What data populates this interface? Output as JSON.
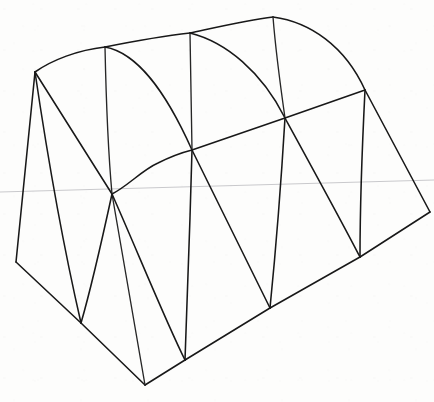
{
  "artwork": {
    "title": "Hand-drawn 3D wireframe mesh sketch",
    "subject": "barrel-vault / quonset-shaped solid drawn in perspective",
    "medium": "pen line drawing on white paper",
    "canvas": {
      "width": 434,
      "height": 402,
      "background_color": "#fdfdfc"
    },
    "ink_color": "#181818",
    "guide_color": "#c9c9cc"
  },
  "chart_data": {
    "type": "scatter",
    "xlabel": "",
    "ylabel": "",
    "xlim": [
      0,
      434
    ],
    "ylim": [
      402,
      0
    ],
    "grid": false,
    "legend": "none",
    "vertices": [
      {
        "id": "TL",
        "x": 35,
        "y": 72,
        "label": "top-left ridge corner"
      },
      {
        "id": "T1",
        "x": 105,
        "y": 47,
        "label": "top rib 1"
      },
      {
        "id": "T2",
        "x": 190,
        "y": 33,
        "label": "top rib 2"
      },
      {
        "id": "T3",
        "x": 273,
        "y": 17,
        "label": "top apex / far ridge corner"
      },
      {
        "id": "R1",
        "x": 365,
        "y": 90,
        "label": "right upper corner"
      },
      {
        "id": "FR",
        "x": 430,
        "y": 212,
        "label": "far right corner"
      },
      {
        "id": "M0",
        "x": 112,
        "y": 194,
        "label": "central convergence node"
      },
      {
        "id": "M1",
        "x": 192,
        "y": 150,
        "label": "mid node 1"
      },
      {
        "id": "M2",
        "x": 285,
        "y": 118,
        "label": "mid node 2"
      },
      {
        "id": "BL",
        "x": 16,
        "y": 262,
        "label": "bottom-left corner"
      },
      {
        "id": "B1",
        "x": 81,
        "y": 323,
        "label": "bottom node 1"
      },
      {
        "id": "B2",
        "x": 145,
        "y": 385,
        "label": "bottom front corner"
      },
      {
        "id": "B3",
        "x": 185,
        "y": 360,
        "label": "bottom node 2"
      },
      {
        "id": "B4",
        "x": 270,
        "y": 308,
        "label": "bottom node 3"
      },
      {
        "id": "B5",
        "x": 360,
        "y": 257,
        "label": "bottom node 4"
      }
    ],
    "edges": [
      {
        "from": "TL",
        "to": "T1",
        "kind": "curve"
      },
      {
        "from": "T1",
        "to": "T2",
        "kind": "curve"
      },
      {
        "from": "T2",
        "to": "T3",
        "kind": "curve"
      },
      {
        "from": "T3",
        "to": "R1",
        "kind": "curve"
      },
      {
        "from": "R1",
        "to": "FR",
        "kind": "line"
      },
      {
        "from": "FR",
        "to": "B5",
        "kind": "line"
      },
      {
        "from": "B5",
        "to": "B4",
        "kind": "line"
      },
      {
        "from": "B4",
        "to": "B3",
        "kind": "line"
      },
      {
        "from": "B3",
        "to": "B2",
        "kind": "line"
      },
      {
        "from": "B2",
        "to": "B1",
        "kind": "line"
      },
      {
        "from": "B1",
        "to": "BL",
        "kind": "line"
      },
      {
        "from": "BL",
        "to": "TL",
        "kind": "line"
      },
      {
        "from": "M0",
        "to": "M1",
        "kind": "curve"
      },
      {
        "from": "M1",
        "to": "M2",
        "kind": "line"
      },
      {
        "from": "M2",
        "to": "R1",
        "kind": "line"
      },
      {
        "from": "TL",
        "to": "M0",
        "kind": "line"
      },
      {
        "from": "T1",
        "to": "M0",
        "kind": "curve"
      },
      {
        "from": "T1",
        "to": "M1",
        "kind": "curve"
      },
      {
        "from": "T2",
        "to": "M1",
        "kind": "line"
      },
      {
        "from": "T2",
        "to": "M2",
        "kind": "curve"
      },
      {
        "from": "T3",
        "to": "M2",
        "kind": "curve"
      },
      {
        "from": "M0",
        "to": "B1",
        "kind": "curve"
      },
      {
        "from": "M0",
        "to": "B2",
        "kind": "line"
      },
      {
        "from": "M0",
        "to": "B3",
        "kind": "curve"
      },
      {
        "from": "M1",
        "to": "B3",
        "kind": "curve"
      },
      {
        "from": "M1",
        "to": "B4",
        "kind": "line"
      },
      {
        "from": "M2",
        "to": "B4",
        "kind": "curve"
      },
      {
        "from": "M2",
        "to": "B5",
        "kind": "curve"
      },
      {
        "from": "R1",
        "to": "B5",
        "kind": "curve"
      },
      {
        "from": "TL",
        "to": "B1",
        "kind": "curve"
      }
    ],
    "guides": [
      {
        "id": "horizon",
        "x1": 0,
        "y1": 192,
        "x2": 434,
        "y2": 180,
        "label": "faint horizontal guide line"
      }
    ]
  }
}
